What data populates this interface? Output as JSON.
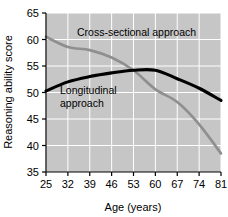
{
  "chart_data": {
    "type": "line",
    "title": "",
    "xlabel": "Age (years)",
    "ylabel": "Reasoning ability score",
    "xlim": [
      25,
      81
    ],
    "ylim": [
      35,
      65
    ],
    "grid": true,
    "legend_position": "inline-annotations",
    "plot_background": "#c6c6c6",
    "gridline_color": "#ffffff",
    "xticks": [
      25,
      32,
      39,
      46,
      53,
      60,
      67,
      74,
      81
    ],
    "yticks": [
      35,
      40,
      45,
      50,
      55,
      60,
      65
    ],
    "xtick_labels": [
      "25",
      "32",
      "39",
      "46",
      "53",
      "60",
      "67",
      "74",
      "81"
    ],
    "ytick_labels": [
      "35",
      "40",
      "45",
      "50",
      "55",
      "60",
      "65"
    ],
    "x": [
      25,
      32,
      39,
      46,
      53,
      60,
      67,
      74,
      81
    ],
    "series": [
      {
        "name": "Cross-sectional approach",
        "color": "#8f8f8f",
        "values": [
          60.5,
          58.6,
          58.0,
          56.6,
          54.2,
          50.6,
          48.2,
          44.0,
          38.5
        ]
      },
      {
        "name": "Longitudinal approach",
        "color": "#000000",
        "values": [
          50.3,
          52.0,
          53.0,
          53.7,
          54.2,
          54.2,
          52.6,
          50.8,
          48.5
        ]
      }
    ],
    "annotations": [
      {
        "id": "cross-sectional-label",
        "text": "Cross-sectional approach",
        "lines": [
          "Cross-sectional approach"
        ],
        "x": 77,
        "y": 36
      },
      {
        "id": "longitudinal-label",
        "text": "Longitudinal approach",
        "lines": [
          "Longitudinal",
          "approach"
        ],
        "x": 60,
        "y": 94
      }
    ]
  }
}
